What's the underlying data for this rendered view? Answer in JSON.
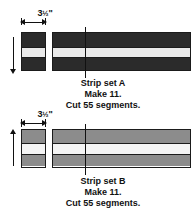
{
  "page": {
    "background_color": "#ffffff",
    "ink_color": "#111111"
  },
  "figures": [
    {
      "id": "strip-set-a",
      "dimension_label": "3",
      "dimension_fraction": "½",
      "dimension_unit": "\"",
      "dimension_full": "3½\"",
      "caption_line_1": "Strip set A",
      "caption_line_2": "Make 11.",
      "caption_line_3": "Cut 55 segments.",
      "bands": [
        {
          "name": "top-dark-band",
          "color": "#2b2b2b"
        },
        {
          "name": "middle-light-band",
          "color": "#e9e9e9"
        },
        {
          "name": "bottom-dark-band",
          "color": "#2b2b2b"
        }
      ],
      "outline_color": "#1b1b1b"
    },
    {
      "id": "strip-set-b",
      "dimension_label": "3",
      "dimension_fraction": "½",
      "dimension_unit": "\"",
      "dimension_full": "3½\"",
      "caption_line_1": "Strip set B",
      "caption_line_2": "Make 11.",
      "caption_line_3": "Cut 55 segments.",
      "bands": [
        {
          "name": "top-gray-band",
          "color": "#8c8c8c"
        },
        {
          "name": "middle-light-band",
          "color": "#f4f4f4"
        },
        {
          "name": "bottom-gray-band",
          "color": "#8c8c8c"
        }
      ],
      "outline_color": "#1b1b1b"
    }
  ]
}
